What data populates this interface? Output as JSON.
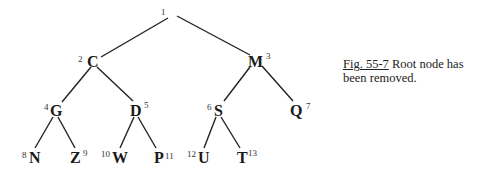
{
  "diagram": {
    "type": "binary-tree",
    "root_label": "1",
    "nodes": [
      {
        "id": 1,
        "letter": "",
        "num": "1",
        "x": 165,
        "y": 16
      },
      {
        "id": 2,
        "letter": "C",
        "num": "2",
        "x": 93,
        "y": 61
      },
      {
        "id": 3,
        "letter": "M",
        "num": "3",
        "x": 256,
        "y": 61
      },
      {
        "id": 4,
        "letter": "G",
        "num": "4",
        "x": 56,
        "y": 110
      },
      {
        "id": 5,
        "letter": "D",
        "num": "5",
        "x": 136,
        "y": 110
      },
      {
        "id": 6,
        "letter": "S",
        "num": "6",
        "x": 219,
        "y": 110
      },
      {
        "id": 7,
        "letter": "Q",
        "num": "7",
        "x": 297,
        "y": 110
      },
      {
        "id": 8,
        "letter": "N",
        "num": "8",
        "x": 34,
        "y": 157
      },
      {
        "id": 9,
        "letter": "Z",
        "num": "9",
        "x": 75,
        "y": 157
      },
      {
        "id": 10,
        "letter": "W",
        "num": "10",
        "x": 118,
        "y": 157
      },
      {
        "id": 11,
        "letter": "P",
        "num": "11",
        "x": 158,
        "y": 157
      },
      {
        "id": 12,
        "letter": "U",
        "num": "12",
        "x": 201,
        "y": 157
      },
      {
        "id": 13,
        "letter": "T",
        "num": "13",
        "x": 242,
        "y": 157
      }
    ],
    "edges": [
      [
        1,
        2
      ],
      [
        1,
        3
      ],
      [
        2,
        4
      ],
      [
        2,
        5
      ],
      [
        3,
        6
      ],
      [
        3,
        7
      ],
      [
        4,
        8
      ],
      [
        4,
        9
      ],
      [
        5,
        10
      ],
      [
        5,
        11
      ],
      [
        6,
        12
      ],
      [
        6,
        13
      ]
    ]
  },
  "caption": {
    "fig_label": "Fig. 55-7",
    "text": " Root node has been removed."
  }
}
